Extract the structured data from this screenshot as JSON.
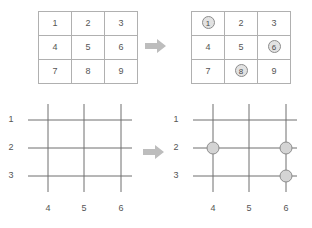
{
  "diagram": {
    "colors": {
      "grid_line": "#b0b0b0",
      "diagram_line": "#6e6e6e",
      "arrow": "#bdbdbd",
      "dot_fill": "#d4d4d4",
      "dot_stroke": "#8c8c8c",
      "text": "#555555"
    }
  },
  "table_before": {
    "name": "number-grid-plain",
    "rows": [
      [
        {
          "value": "1",
          "marked": false
        },
        {
          "value": "2",
          "marked": false
        },
        {
          "value": "3",
          "marked": false
        }
      ],
      [
        {
          "value": "4",
          "marked": false
        },
        {
          "value": "5",
          "marked": false
        },
        {
          "value": "6",
          "marked": false
        }
      ],
      [
        {
          "value": "7",
          "marked": false
        },
        {
          "value": "8",
          "marked": false
        },
        {
          "value": "9",
          "marked": false
        }
      ]
    ]
  },
  "table_after": {
    "name": "number-grid-marked",
    "rows": [
      [
        {
          "value": "1",
          "marked": true
        },
        {
          "value": "2",
          "marked": false
        },
        {
          "value": "3",
          "marked": false
        }
      ],
      [
        {
          "value": "4",
          "marked": false
        },
        {
          "value": "5",
          "marked": false
        },
        {
          "value": "6",
          "marked": true
        }
      ],
      [
        {
          "value": "7",
          "marked": false
        },
        {
          "value": "8",
          "marked": true
        },
        {
          "value": "9",
          "marked": false
        }
      ]
    ],
    "marked_values": [
      "1",
      "6",
      "8"
    ]
  },
  "arrows": {
    "top_label": "transforms-to",
    "bottom_label": "transforms-to"
  },
  "diagram_before": {
    "name": "line-grid-plain",
    "row_labels": [
      "1",
      "2",
      "3"
    ],
    "col_labels": [
      "4",
      "5",
      "6"
    ],
    "dots": []
  },
  "diagram_after": {
    "name": "line-grid-with-intersections",
    "row_labels": [
      "1",
      "2",
      "3"
    ],
    "col_labels": [
      "4",
      "5",
      "6"
    ],
    "dots": [
      {
        "col": "4",
        "row": "2"
      },
      {
        "col": "6",
        "row": "2"
      },
      {
        "col": "6",
        "row": "3"
      }
    ]
  }
}
